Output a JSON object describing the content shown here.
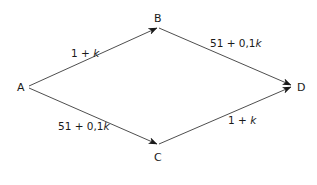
{
  "diagram": {
    "type": "directed-network",
    "nodes": [
      {
        "id": "A",
        "label": "A",
        "x": 28,
        "y": 87
      },
      {
        "id": "B",
        "label": "B",
        "x": 158,
        "y": 27
      },
      {
        "id": "C",
        "label": "C",
        "x": 158,
        "y": 145
      },
      {
        "id": "D",
        "label": "D",
        "x": 292,
        "y": 86
      }
    ],
    "edges": [
      {
        "from": "A",
        "to": "B",
        "label_prefix": "1 + ",
        "label_var": "k"
      },
      {
        "from": "B",
        "to": "D",
        "label_prefix": "51 + 0,1",
        "label_var": "k"
      },
      {
        "from": "A",
        "to": "C",
        "label_prefix": "51 + 0,1",
        "label_var": "k"
      },
      {
        "from": "C",
        "to": "D",
        "label_prefix": "1 + ",
        "label_var": "k"
      }
    ],
    "colors": {
      "line": "#3a3a3a",
      "text": "#1a1a1a",
      "background": "#ffffff"
    }
  }
}
